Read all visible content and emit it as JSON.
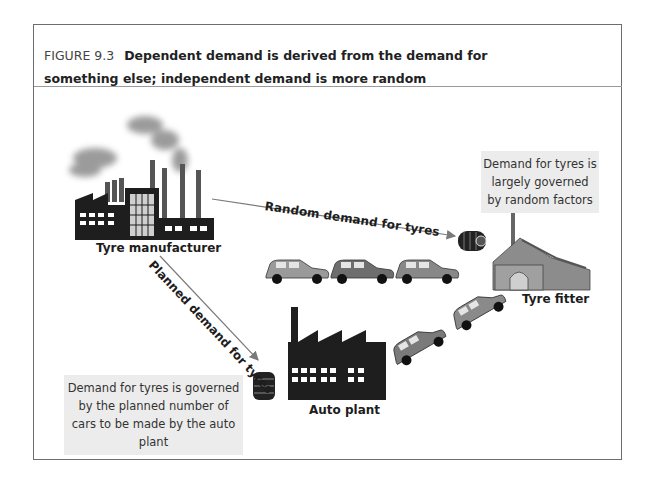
{
  "figure": {
    "number": "FIGURE 9.3",
    "title": "Dependent demand is derived from the demand for something else; independent demand is more random"
  },
  "nodes": {
    "tyre_manufacturer": "Tyre manufacturer",
    "tyre_fitter": "Tyre fitter",
    "auto_plant": "Auto plant"
  },
  "flows": {
    "random": "Random demand for tyres",
    "planned": "Planned demand for tyres"
  },
  "notes": {
    "independent": "Demand for tyres is largely governed by random factors",
    "dependent": "Demand for tyres is governed by the planned number of cars to be made by the auto plant"
  },
  "colors": {
    "factory": "#1e1e1e",
    "smoke": "#8a8a8a",
    "car_light": "#9a9a9a",
    "car_dark": "#6e6e6e",
    "building": "#8c8c8c",
    "note_bg": "#ececec",
    "arrow": "#7a7a7a"
  }
}
